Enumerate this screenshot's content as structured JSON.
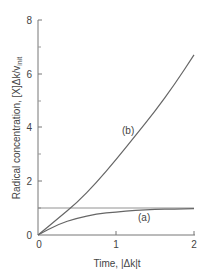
{
  "chart_data": {
    "type": "line",
    "title": "",
    "xlabel": "Time, |Δk|t",
    "ylabel": "Radical concentration, [X]Δk/v_init",
    "xlim": [
      0,
      2
    ],
    "ylim": [
      0,
      8
    ],
    "x_ticks": [
      "0",
      "1",
      "2"
    ],
    "y_ticks": [
      "0",
      "2",
      "4",
      "6",
      "8"
    ],
    "grid": false,
    "reference_line": {
      "y": 1
    },
    "x": [
      0,
      0.25,
      0.5,
      0.75,
      1.0,
      1.25,
      1.5,
      1.75,
      2.0
    ],
    "series": [
      {
        "name": "(a)",
        "values": [
          0,
          0.39,
          0.63,
          0.78,
          0.86,
          0.92,
          0.95,
          0.97,
          0.98
        ]
      },
      {
        "name": "(b)",
        "values": [
          0,
          0.6,
          1.2,
          1.95,
          2.8,
          3.7,
          4.6,
          5.6,
          6.7
        ]
      }
    ],
    "annotations": [
      "(a)",
      "(b)"
    ]
  },
  "labels": {
    "xlabel": "Time, |Δk|t",
    "ylabel_main": "Radical concentration, [X]Δk/v",
    "ylabel_sub": "init",
    "series_a": "(a)",
    "series_b": "(b)",
    "x_ticks": [
      "0",
      "1",
      "2"
    ],
    "y_ticks": [
      "0",
      "2",
      "4",
      "6",
      "8"
    ]
  }
}
